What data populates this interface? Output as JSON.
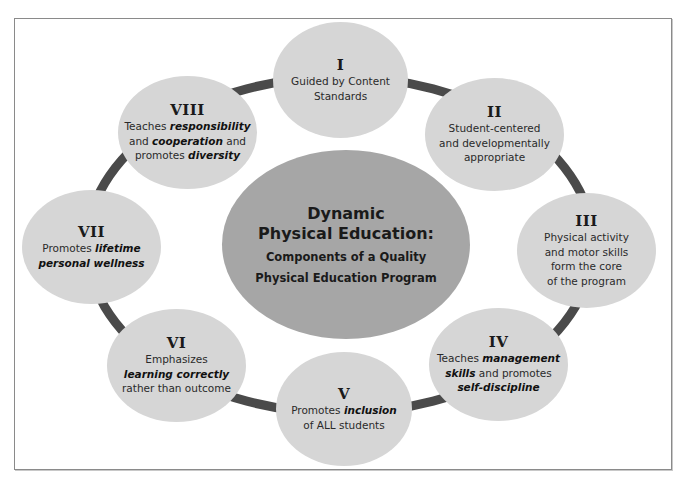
{
  "colors": {
    "ring": "#4a4a4a",
    "node_fill": "#d6d6d6",
    "center_fill": "#a6a6a6",
    "frame_border": "#8a8a8a"
  },
  "center": {
    "title_line1": "Dynamic",
    "title_line2": "Physical Education:",
    "subtitle_line1": "Components of a Quality",
    "subtitle_line2": "Physical Education Program"
  },
  "nodes": [
    {
      "numeral": "I",
      "lines": [
        [
          {
            "t": "Guided by Content"
          }
        ],
        [
          {
            "t": "Standards"
          }
        ]
      ]
    },
    {
      "numeral": "II",
      "lines": [
        [
          {
            "t": "Student-centered"
          }
        ],
        [
          {
            "t": "and developmentally"
          }
        ],
        [
          {
            "t": "appropriate"
          }
        ]
      ]
    },
    {
      "numeral": "III",
      "lines": [
        [
          {
            "t": "Physical activity"
          }
        ],
        [
          {
            "t": "and motor skills"
          }
        ],
        [
          {
            "t": "form the core"
          }
        ],
        [
          {
            "t": "of the program"
          }
        ]
      ]
    },
    {
      "numeral": "IV",
      "lines": [
        [
          {
            "t": "Teaches "
          },
          {
            "t": "management",
            "em": true
          }
        ],
        [
          {
            "t": "skills",
            "em": true
          },
          {
            "t": " and promotes"
          }
        ],
        [
          {
            "t": "self-discipline",
            "em": true
          }
        ]
      ]
    },
    {
      "numeral": "V",
      "lines": [
        [
          {
            "t": "Promotes "
          },
          {
            "t": "inclusion",
            "em": true
          }
        ],
        [
          {
            "t": "of ALL students"
          }
        ]
      ]
    },
    {
      "numeral": "VI",
      "lines": [
        [
          {
            "t": "Emphasizes"
          }
        ],
        [
          {
            "t": "learning correctly",
            "em": true
          }
        ],
        [
          {
            "t": "rather than outcome"
          }
        ]
      ]
    },
    {
      "numeral": "VII",
      "lines": [
        [
          {
            "t": "Promotes "
          },
          {
            "t": "lifetime",
            "em": true
          }
        ],
        [
          {
            "t": "personal wellness",
            "em": true
          }
        ]
      ]
    },
    {
      "numeral": "VIII",
      "lines": [
        [
          {
            "t": "Teaches "
          },
          {
            "t": "responsibility",
            "em": true
          }
        ],
        [
          {
            "t": "and "
          },
          {
            "t": "cooperation",
            "em": true
          },
          {
            "t": " and"
          }
        ],
        [
          {
            "t": "promotes "
          },
          {
            "t": "diversity",
            "em": true
          }
        ]
      ]
    }
  ]
}
